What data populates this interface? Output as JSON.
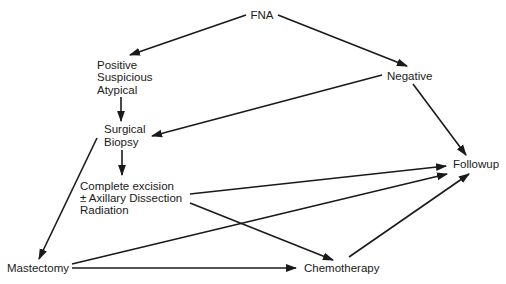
{
  "diagram": {
    "type": "flowchart",
    "nodes": {
      "fna": {
        "lines": [
          "FNA"
        ]
      },
      "positive": {
        "lines": [
          "Positive",
          "Suspicious",
          "Atypical"
        ]
      },
      "negative": {
        "lines": [
          "Negative"
        ]
      },
      "biopsy": {
        "lines": [
          "Surgical",
          "Biopsy"
        ]
      },
      "excision": {
        "lines": [
          "Complete excision",
          "± Axillary Dissection",
          "Radiation"
        ]
      },
      "followup": {
        "lines": [
          "Followup"
        ]
      },
      "mastectomy": {
        "lines": [
          "Mastectomy"
        ]
      },
      "chemotherapy": {
        "lines": [
          "Chemotherapy"
        ]
      }
    },
    "edges": [
      {
        "from": "fna",
        "to": "positive"
      },
      {
        "from": "fna",
        "to": "negative"
      },
      {
        "from": "positive",
        "to": "biopsy"
      },
      {
        "from": "negative",
        "to": "biopsy"
      },
      {
        "from": "negative",
        "to": "followup"
      },
      {
        "from": "biopsy",
        "to": "excision"
      },
      {
        "from": "biopsy",
        "to": "mastectomy"
      },
      {
        "from": "excision",
        "to": "followup"
      },
      {
        "from": "excision",
        "to": "chemotherapy"
      },
      {
        "from": "mastectomy",
        "to": "followup"
      },
      {
        "from": "mastectomy",
        "to": "chemotherapy"
      },
      {
        "from": "chemotherapy",
        "to": "followup"
      }
    ]
  }
}
